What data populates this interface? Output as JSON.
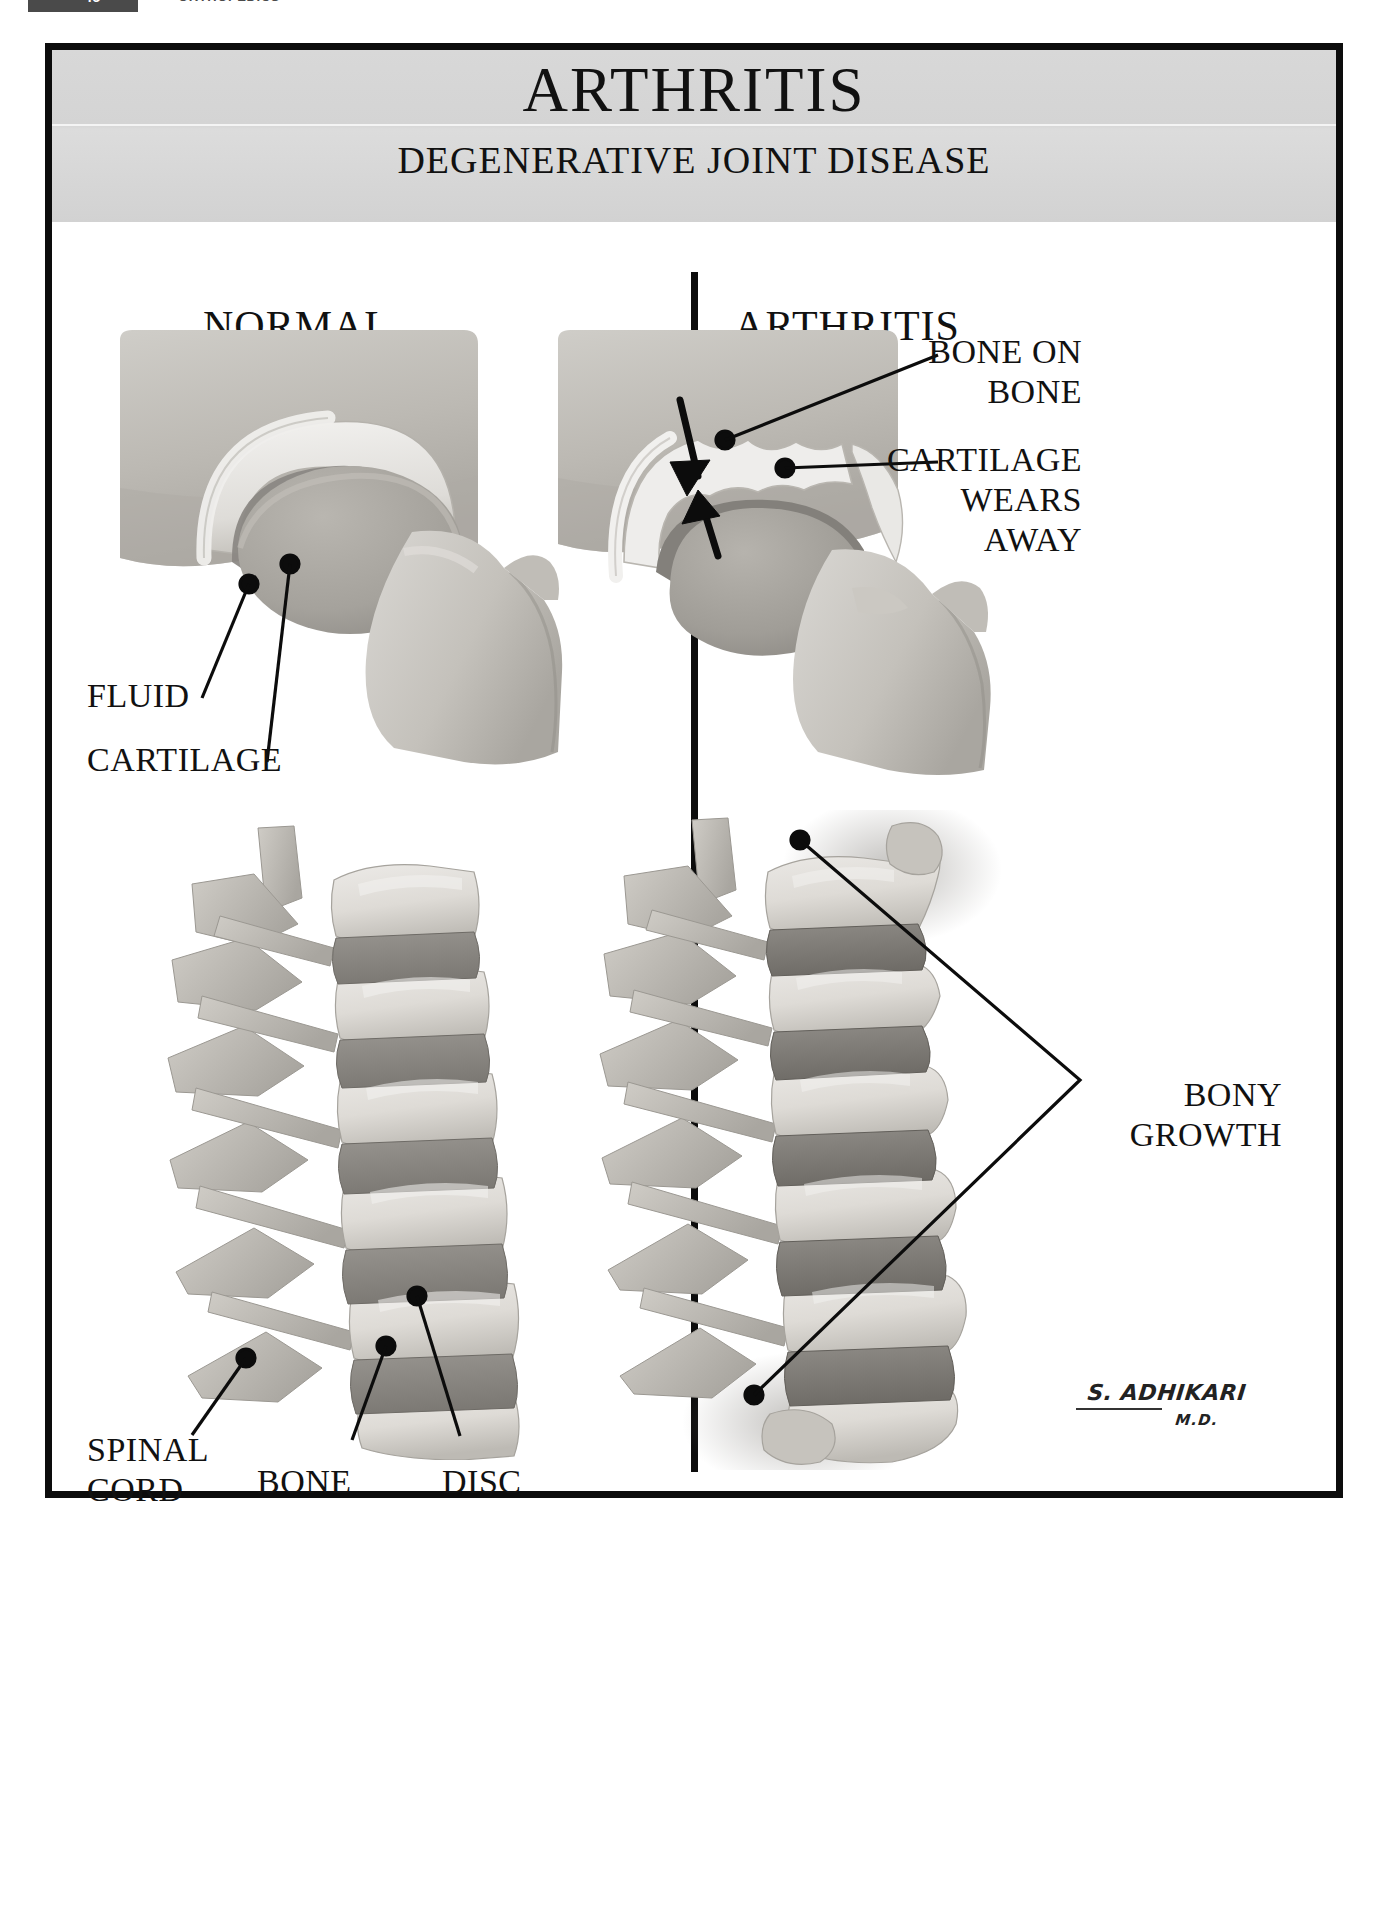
{
  "page_header": {
    "folio": "46",
    "section": "ORTHOPEDICS"
  },
  "poster": {
    "title": "ARTHRITIS",
    "subtitle": "DEGENERATIVE JOINT DISEASE",
    "columns": [
      {
        "id": "normal",
        "heading": "NORMAL"
      },
      {
        "id": "arthritis",
        "heading": "ARTHRITIS"
      }
    ],
    "figures": [
      {
        "id": "normal-joint",
        "column": "normal",
        "caption": "normal hip joint cross-section",
        "labels": [
          {
            "id": "fluid",
            "text": "FLUID"
          },
          {
            "id": "cartilage",
            "text": "CARTILAGE"
          }
        ]
      },
      {
        "id": "arthritic-joint",
        "column": "arthritis",
        "caption": "arthritic hip joint cross-section",
        "labels": [
          {
            "id": "bone-on-bone",
            "text": "BONE ON\nBONE"
          },
          {
            "id": "cartilage-wears-away",
            "text": "CARTILAGE\nWEARS\nAWAY"
          }
        ]
      },
      {
        "id": "normal-spine",
        "column": "normal",
        "caption": "normal lumbar spine lateral view",
        "labels": [
          {
            "id": "spinal-cord",
            "text": "SPINAL\nCORD"
          },
          {
            "id": "bone",
            "text": "BONE"
          },
          {
            "id": "disc",
            "text": "DISC"
          }
        ]
      },
      {
        "id": "arthritic-spine",
        "column": "arthritis",
        "caption": "arthritic lumbar spine lateral view",
        "labels": [
          {
            "id": "bony-growth",
            "text": "BONY\nGROWTH"
          }
        ]
      }
    ],
    "signature": {
      "name": "S. ADHIKARI",
      "credential": "M.D."
    }
  },
  "palette": {
    "ink": "#0c0c0c",
    "banner_gray": "#d6d6d6",
    "bone_light": "#d6d4d0",
    "bone_mid": "#bdbab4",
    "bone_shadow": "#9a9792",
    "cartilage": "#ececea",
    "disc_dark": "#8d8a85",
    "page_white": "#ffffff"
  }
}
